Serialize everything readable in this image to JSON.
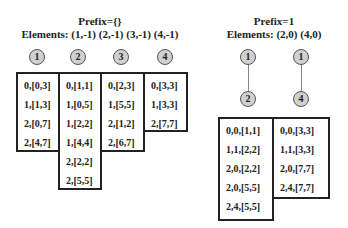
{
  "left": {
    "title_line1": "Prefix={}",
    "title_line2": "Elements: (1,-1) (2,-1) (3,-1) (4,-1)",
    "nodes": [
      "1",
      "2",
      "3",
      "4"
    ],
    "columns": [
      {
        "items": [
          "0,[0,3]",
          "1,[1,3]",
          "2,[0,7]",
          "2,[4,7]"
        ]
      },
      {
        "items": [
          "0,[1,1]",
          "1,[0,5]",
          "1,[2,2]",
          "1,[4,4]",
          "2,[2,2]",
          "2,[5,5]"
        ]
      },
      {
        "items": [
          "0,[2,3]",
          "1,[5,5]",
          "2,[1,2]",
          "2,[6,7]"
        ]
      },
      {
        "items": [
          "0,[3,3]",
          "1,[3,3]",
          "2,[7,7]"
        ]
      }
    ]
  },
  "right": {
    "title_line1": "Prefix=1",
    "title_line2": "Elements: (2,0) (4,0)",
    "trees": [
      {
        "top": "1",
        "bottom": "2"
      },
      {
        "top": "1",
        "bottom": "4"
      }
    ],
    "columns": [
      {
        "items": [
          "0,0,[1,1]",
          "1,1,[2,2]",
          "2,0,[2,2]",
          "2,0,[5,5]",
          "2,4,[5,5]"
        ]
      },
      {
        "items": [
          "0,0,[3,3]",
          "1,1,[3,3]",
          "2,0,[7,7]",
          "2,4,[7,7]"
        ]
      }
    ]
  }
}
